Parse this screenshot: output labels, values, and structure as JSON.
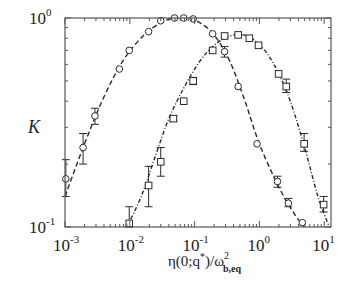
{
  "chart_data": {
    "type": "scatter",
    "title": "",
    "xlabel": "η(0;q*)/ω²_b,eq",
    "xlabel_parts": {
      "main": "η(0;q",
      "star": "*",
      "mid": ")/ω",
      "sup": "2",
      "sub": "b,eq"
    },
    "ylabel": "K",
    "xscale": "log",
    "yscale": "log",
    "xlim": [
      0.001,
      14
    ],
    "ylim": [
      0.1,
      1.0
    ],
    "x_ticks": [
      {
        "value": 0.001,
        "base": "10",
        "exp": "-3"
      },
      {
        "value": 0.01,
        "base": "10",
        "exp": "-2"
      },
      {
        "value": 0.1,
        "base": "10",
        "exp": "-1"
      },
      {
        "value": 1,
        "base": "10",
        "exp": "0"
      },
      {
        "value": 10,
        "base": "10",
        "exp": "1"
      }
    ],
    "y_ticks": [
      {
        "value": 0.1,
        "base": "10",
        "exp": "-1"
      },
      {
        "value": 1.0,
        "base": "10",
        "exp": "0"
      }
    ],
    "grid": false,
    "legend": null,
    "series": [
      {
        "name": "circles",
        "marker": "circle",
        "line_style": "dashed",
        "points": [
          {
            "x": 0.00103,
            "y": 0.17,
            "err": [
              0.14,
              0.21
            ]
          },
          {
            "x": 0.0019,
            "y": 0.24,
            "err": [
              0.2,
              0.28
            ]
          },
          {
            "x": 0.0029,
            "y": 0.34,
            "err": [
              0.31,
              0.37
            ]
          },
          {
            "x": 0.0069,
            "y": 0.57
          },
          {
            "x": 0.0098,
            "y": 0.7
          },
          {
            "x": 0.0195,
            "y": 0.86
          },
          {
            "x": 0.03,
            "y": 0.97
          },
          {
            "x": 0.049,
            "y": 1.0
          },
          {
            "x": 0.068,
            "y": 1.0
          },
          {
            "x": 0.095,
            "y": 0.99
          },
          {
            "x": 0.19,
            "y": 0.84
          },
          {
            "x": 0.29,
            "y": 0.69,
            "err": [
              0.65,
              0.73
            ]
          },
          {
            "x": 0.47,
            "y": 0.47
          },
          {
            "x": 0.92,
            "y": 0.25
          },
          {
            "x": 1.9,
            "y": 0.165,
            "err": [
              0.155,
              0.175
            ]
          },
          {
            "x": 2.8,
            "y": 0.13,
            "err": [
              0.125,
              0.137
            ]
          },
          {
            "x": 4.6,
            "y": 0.105
          }
        ]
      },
      {
        "name": "squares",
        "marker": "square",
        "line_style": "dash-dot",
        "points": [
          {
            "x": 0.0098,
            "y": 0.104,
            "err": [
              0.1,
              0.125
            ]
          },
          {
            "x": 0.0195,
            "y": 0.158,
            "err": [
              0.125,
              0.195
            ]
          },
          {
            "x": 0.03,
            "y": 0.205,
            "err": [
              0.175,
              0.24
            ]
          },
          {
            "x": 0.047,
            "y": 0.33,
            "err": [
              0.32,
              0.34
            ]
          },
          {
            "x": 0.068,
            "y": 0.4
          },
          {
            "x": 0.095,
            "y": 0.5,
            "err": [
              0.48,
              0.52
            ]
          },
          {
            "x": 0.19,
            "y": 0.7
          },
          {
            "x": 0.29,
            "y": 0.82
          },
          {
            "x": 0.47,
            "y": 0.83
          },
          {
            "x": 0.7,
            "y": 0.8
          },
          {
            "x": 0.97,
            "y": 0.74
          },
          {
            "x": 1.98,
            "y": 0.54
          },
          {
            "x": 2.6,
            "y": 0.47,
            "err": [
              0.44,
              0.51
            ]
          },
          {
            "x": 4.9,
            "y": 0.25,
            "err": [
              0.23,
              0.28
            ]
          },
          {
            "x": 9.8,
            "y": 0.128,
            "err": [
              0.118,
              0.14
            ]
          }
        ]
      }
    ],
    "curves": [
      {
        "name": "dashed-fit",
        "style": "dashed",
        "points": [
          [
            0.001,
            0.14
          ],
          [
            0.002,
            0.25
          ],
          [
            0.004,
            0.42
          ],
          [
            0.008,
            0.63
          ],
          [
            0.016,
            0.82
          ],
          [
            0.03,
            0.95
          ],
          [
            0.05,
            1.0
          ],
          [
            0.08,
            1.0
          ],
          [
            0.12,
            0.95
          ],
          [
            0.2,
            0.83
          ],
          [
            0.35,
            0.62
          ],
          [
            0.6,
            0.4
          ],
          [
            1.0,
            0.25
          ],
          [
            2.0,
            0.155
          ],
          [
            3.5,
            0.115
          ],
          [
            5.0,
            0.1
          ]
        ]
      },
      {
        "name": "dash-dot-fit",
        "style": "dashdot",
        "points": [
          [
            0.009,
            0.1
          ],
          [
            0.015,
            0.14
          ],
          [
            0.025,
            0.22
          ],
          [
            0.04,
            0.33
          ],
          [
            0.07,
            0.47
          ],
          [
            0.12,
            0.62
          ],
          [
            0.2,
            0.74
          ],
          [
            0.35,
            0.82
          ],
          [
            0.55,
            0.83
          ],
          [
            0.8,
            0.79
          ],
          [
            1.3,
            0.68
          ],
          [
            2.0,
            0.54
          ],
          [
            3.0,
            0.4
          ],
          [
            5.0,
            0.24
          ],
          [
            8.0,
            0.14
          ],
          [
            12.0,
            0.1
          ]
        ]
      }
    ]
  },
  "layout": {
    "plot_left": 65,
    "plot_right": 331,
    "plot_top": 18,
    "plot_bottom": 227,
    "line_color": "#2a2a2a",
    "axis_color": "#555555"
  }
}
